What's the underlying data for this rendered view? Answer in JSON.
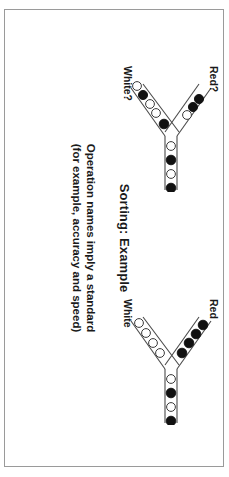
{
  "slide": {
    "title": "Sorting: Example",
    "body_lines": [
      "Operation names imply a standard",
      "(for example, accuracy and speed)"
    ],
    "border_color": "#9a9a9a",
    "background_color": "#ffffff",
    "text_color": "#1a1a1a"
  },
  "diagrams": [
    {
      "id": "top",
      "name": "sorting-diagram-unsorted",
      "upper_branch_label": "Red?",
      "lower_branch_label": "White?",
      "upper_branch_balls": [
        "black",
        "black",
        "white"
      ],
      "lower_branch_balls": [
        "white",
        "black",
        "white",
        "white",
        "black"
      ],
      "trunk_balls": [
        "white",
        "black",
        "white",
        "black"
      ]
    },
    {
      "id": "bottom",
      "name": "sorting-diagram-sorted",
      "upper_branch_label": "Red",
      "lower_branch_label": "White",
      "upper_branch_balls": [
        "black",
        "black",
        "black",
        "black"
      ],
      "lower_branch_balls": [
        "white",
        "white",
        "white",
        "white"
      ],
      "trunk_balls": [
        "white",
        "black",
        "white",
        "black"
      ]
    }
  ],
  "colors": {
    "ball_black": "#111111",
    "ball_white": "#ffffff",
    "ball_outline": "#3a3a3a",
    "track": "#4a4a4a"
  }
}
